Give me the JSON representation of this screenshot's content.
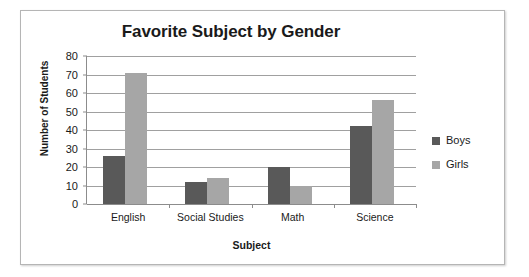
{
  "chart_data": {
    "type": "bar",
    "title": "Favorite Subject by Gender",
    "xlabel": "Subject",
    "ylabel": "Number of Students",
    "categories": [
      "English",
      "Social Studies",
      "Math",
      "Science"
    ],
    "series": [
      {
        "name": "Boys",
        "color": "#595959",
        "values": [
          26,
          12,
          20,
          42
        ]
      },
      {
        "name": "Girls",
        "color": "#a6a6a6",
        "values": [
          71,
          14,
          10,
          56
        ]
      }
    ],
    "ylim": [
      0,
      80
    ],
    "ytick_step": 10,
    "yticks": [
      "80",
      "70",
      "60",
      "50",
      "40",
      "30",
      "20",
      "10",
      "0"
    ],
    "grid": true,
    "grid_axis": "y",
    "legend_position": "right",
    "legend": [
      "Boys",
      "Girls"
    ],
    "background_color": "#ffffff",
    "grid_color": "#a0a0a0",
    "axis_color": "#8c8c8c",
    "frame_border_color": "#b5b5b5"
  }
}
